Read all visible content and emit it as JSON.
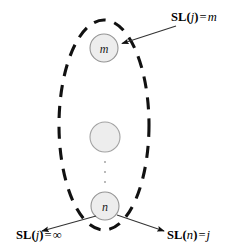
{
  "figure": {
    "type": "node-group-diagram",
    "background_color": "#ffffff",
    "stroke_color": "#1a1a1a",
    "node_fill_color": "#ededed",
    "node_stroke_color": "#8c8c8c",
    "group_boundary": {
      "shape": "ellipse",
      "style": "dashed",
      "center_x": 104,
      "center_y": 125,
      "radius_x": 45,
      "radius_y": 105
    }
  },
  "nodes": [
    {
      "id": "node-m",
      "label": "m",
      "cx": 104,
      "cy": 48,
      "r": 14
    },
    {
      "id": "node-middle",
      "label": "",
      "cx": 105,
      "cy": 137,
      "r": 15
    },
    {
      "id": "node-n",
      "label": "n",
      "cx": 105,
      "cy": 206,
      "r": 14
    }
  ],
  "vertical_ellipsis": {
    "name": "vertical-dots",
    "dots": 3,
    "cx": 105,
    "y_positions": [
      162,
      172,
      182
    ]
  },
  "annotations": [
    {
      "id": "label-top",
      "name": "annotation-sl-j-equals-m",
      "function": "SL",
      "argument": "j",
      "operator": "=",
      "value": "m",
      "full_text": "SL(j) = m",
      "target_node": "node-m"
    },
    {
      "id": "label-bottom-left",
      "name": "annotation-sl-j-equals-infinity",
      "function": "SL",
      "argument": "j",
      "operator": "=",
      "value": "∞",
      "full_text": "SL(j) = ∞",
      "target_node": "node-n"
    },
    {
      "id": "label-bottom-right",
      "name": "annotation-sl-n-equals-j",
      "function": "SL",
      "argument": "n",
      "operator": "=",
      "value": "j",
      "full_text": "SL(n) = j",
      "target_node": "node-n"
    }
  ],
  "arrows": [
    {
      "name": "arrow-to-node-m",
      "from_x": 176,
      "from_y": 26,
      "to_x": 120,
      "to_y": 44
    },
    {
      "name": "arrow-to-bottom-left",
      "from_x": 96,
      "from_y": 216,
      "to_x": 40,
      "to_y": 232
    },
    {
      "name": "arrow-to-bottom-right",
      "from_x": 117,
      "from_y": 215,
      "to_x": 165,
      "to_y": 231
    }
  ]
}
